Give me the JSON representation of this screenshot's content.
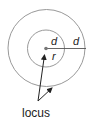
{
  "diagram": {
    "labels": {
      "inner_distance": "d",
      "outer_distance": "d",
      "radius": "r",
      "caption": "locus"
    },
    "colors": {
      "stroke": "#999999",
      "ink": "#222222",
      "background": "#ffffff"
    }
  }
}
